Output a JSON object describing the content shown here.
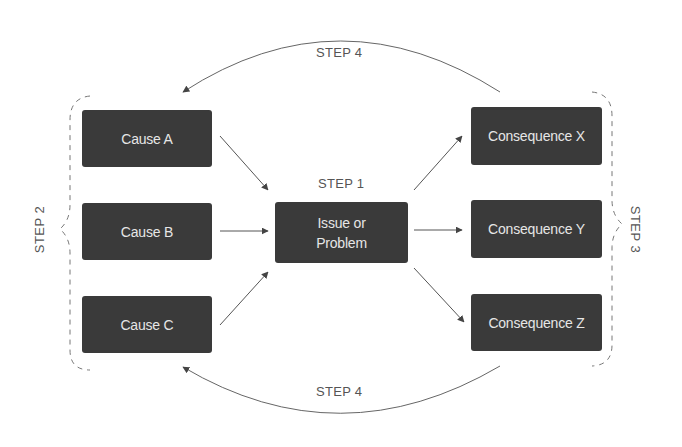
{
  "diagram": {
    "step1_label": "STEP 1",
    "step2_label": "STEP 2",
    "step3_label": "STEP 3",
    "step4_top_label": "STEP 4",
    "step4_bottom_label": "STEP 4",
    "center": {
      "line1": "Issue or",
      "line2": "Problem"
    },
    "causes": [
      "Cause A",
      "Cause B",
      "Cause C"
    ],
    "consequences": [
      "Consequence X",
      "Consequence Y",
      "Consequence Z"
    ],
    "colors": {
      "box_fill": "#3a3a3a",
      "box_text": "#e6e6e6",
      "line": "#555555",
      "label": "#555555"
    }
  }
}
